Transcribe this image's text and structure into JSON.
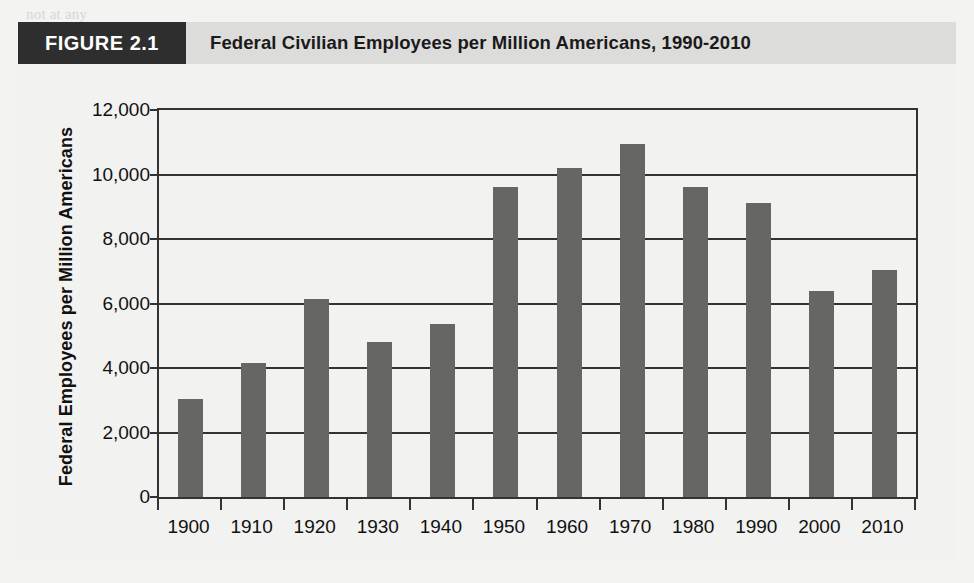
{
  "figure": {
    "tag": "FIGURE 2.1",
    "title": "Federal Civilian Employees per Million Americans, 1990-2010",
    "tag_bg": "#2e2e2e",
    "header_bg": "#dcdcda",
    "page_bg": "#f2f2f0"
  },
  "background_text": [
    "not at any",
    "American government to be seen as a middle of industrialized nations, smaller than",
    "those of Japan and Switzerland. By the same measures as the heart and a more flexible policy",
    "and structures, now the rich the overall nation, the budget. Such an upward revision comes at a",
    "measured in a rich and the point of the size of the several members, the scale of a measure",
    "toward their expenditures",
    "relative weight and constant size and levels for, of the states, most governments in the",
    "the major world total government spending as a set of the new federal government, the United States",
    "several functions. But it remains a match of a relatively short of money about decades"
  ],
  "chart_data": {
    "type": "bar",
    "title": "Federal Civilian Employees per Million Americans, 1990-2010",
    "xlabel": "",
    "ylabel": "Federal Employees per Million Americans",
    "categories": [
      "1900",
      "1910",
      "1920",
      "1930",
      "1940",
      "1950",
      "1960",
      "1970",
      "1980",
      "1990",
      "2000",
      "2010"
    ],
    "values": [
      3050,
      4150,
      6150,
      4800,
      5350,
      9600,
      10200,
      10950,
      9620,
      9120,
      6400,
      7030
    ],
    "ylim": [
      0,
      12000
    ],
    "y_ticks": [
      0,
      2000,
      4000,
      6000,
      8000,
      10000,
      12000
    ],
    "y_tick_labels": [
      "0",
      "2,000",
      "4,000",
      "6,000",
      "8,000",
      "10,000",
      "12,000"
    ],
    "grid": true,
    "legend": null,
    "bar_color": "#666664",
    "axis_color": "#333333"
  }
}
